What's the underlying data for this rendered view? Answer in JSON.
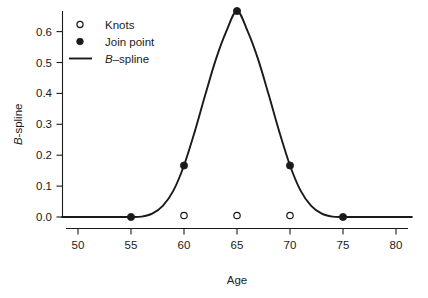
{
  "chart_data": {
    "type": "line",
    "title": "",
    "subtitle": "",
    "xlabel": "Age",
    "ylabel": "B-spline",
    "ylabel_italic_prefix": "B",
    "ylabel_rest": "-spline",
    "xlim": [
      48.5,
      81.5
    ],
    "ylim": [
      -0.02,
      0.69
    ],
    "xticks": [
      50,
      55,
      60,
      65,
      70,
      75,
      80
    ],
    "xticklabels": [
      "50",
      "55",
      "60",
      "65",
      "70",
      "75",
      "80"
    ],
    "yticks": [
      0.0,
      0.1,
      0.2,
      0.3,
      0.4,
      0.5,
      0.6
    ],
    "yticklabels": [
      "0.0",
      "0.1",
      "0.2",
      "0.3",
      "0.4",
      "0.5",
      "0.6"
    ],
    "grid": false,
    "legend_position": "top-left-inside",
    "line_color": "#1a1a1a",
    "series": [
      {
        "name": "B-spline",
        "type": "line",
        "x": [
          48.5,
          50,
          52,
          54,
          55,
          56,
          57,
          58,
          59,
          60,
          61,
          62,
          63,
          64,
          65,
          66,
          67,
          68,
          69,
          70,
          71,
          72,
          73,
          74,
          75,
          76,
          78,
          80,
          81.5
        ],
        "y": [
          0.0,
          0.0,
          0.0,
          0.0,
          0.0,
          0.0013,
          0.0107,
          0.036,
          0.0853,
          0.1667,
          0.2747,
          0.3947,
          0.5093,
          0.6013,
          0.6667,
          0.6013,
          0.5093,
          0.3947,
          0.2747,
          0.1667,
          0.0853,
          0.036,
          0.0107,
          0.0013,
          0.0,
          0.0,
          0.0,
          0.0,
          0.0
        ]
      },
      {
        "name": "Join point",
        "type": "scatter",
        "marker": "filled-circle",
        "x": [
          55,
          60,
          65,
          70,
          75
        ],
        "y": [
          0.0,
          0.1667,
          0.6667,
          0.1667,
          0.0
        ]
      },
      {
        "name": "Knots",
        "type": "scatter",
        "marker": "open-circle",
        "x": [
          60,
          65,
          70
        ],
        "y": [
          0.0,
          0.0,
          0.0
        ]
      }
    ],
    "legend_entries": [
      {
        "label": "Knots",
        "marker": "open-circle"
      },
      {
        "label": "Join point",
        "marker": "filled-circle"
      },
      {
        "label_italic_prefix": "B",
        "label_rest": "–spline",
        "label": "B–spline",
        "marker": "line"
      }
    ]
  }
}
